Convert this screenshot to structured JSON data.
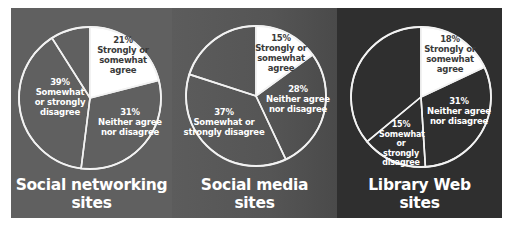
{
  "chart_data": [
    {
      "type": "pie",
      "title": "Social networking sites",
      "categories": [
        "Strongly or somewhat agree",
        "Neither agree nor disagree",
        "Somewhat or strongly disagree",
        "Unlabeled"
      ],
      "values": [
        21,
        31,
        39,
        9
      ],
      "labels": [
        "21%",
        "31%",
        "39%",
        ""
      ]
    },
    {
      "type": "pie",
      "title": "Social media sites",
      "categories": [
        "Strongly or somewhat agree",
        "Neither agree nor disagree",
        "Somewhat or strongly disagree",
        "Unlabeled"
      ],
      "values": [
        15,
        28,
        37,
        20
      ],
      "labels": [
        "15%",
        "28%",
        "37%",
        ""
      ]
    },
    {
      "type": "pie",
      "title": "Library Web sites",
      "categories": [
        "Strongly or somewhat agree",
        "Neither agree nor disagree",
        "Somewhat or strongly disagree",
        "Unlabeled"
      ],
      "values": [
        18,
        31,
        15,
        36
      ],
      "labels": [
        "18%",
        "31%",
        "15%",
        ""
      ]
    }
  ],
  "panels": [
    {
      "title_line1": "Social networking",
      "title_line2": "sites",
      "agree": {
        "pct": "21%",
        "l1": "Strongly or",
        "l2": "somewhat",
        "l3": "agree"
      },
      "neither": {
        "pct": "31%",
        "l1": "Neither agree",
        "l2": "nor disagree"
      },
      "disagree": {
        "pct": "39%",
        "l1": "Somewhat",
        "l2": "or strongly",
        "l3": "disagree"
      }
    },
    {
      "title_line1": "Social media",
      "title_line2": "sites",
      "agree": {
        "pct": "15%",
        "l1": "Strongly or",
        "l2": "somewhat",
        "l3": "agree"
      },
      "neither": {
        "pct": "28%",
        "l1": "Neither agree",
        "l2": "nor disagree"
      },
      "disagree": {
        "pct": "37%",
        "l1": "Somewhat or",
        "l2": "strongly disagree"
      }
    },
    {
      "title_line1": "Library Web",
      "title_line2": "sites",
      "agree": {
        "pct": "18%",
        "l1": "Strongly or",
        "l2": "somewhat",
        "l3": "agree"
      },
      "neither": {
        "pct": "31%",
        "l1": "Neither agree",
        "l2": "nor disagree"
      },
      "disagree": {
        "pct": "15%",
        "l1": "Somewhat",
        "l2": "or strongly",
        "l3": "disagree"
      }
    }
  ],
  "colors": {
    "agree_slice": "#ffffff",
    "outline": "#f2f2f2",
    "panel1_bg": "#606060",
    "panel2_bg": "#555555",
    "panel3_bg": "#2f2f2f"
  }
}
